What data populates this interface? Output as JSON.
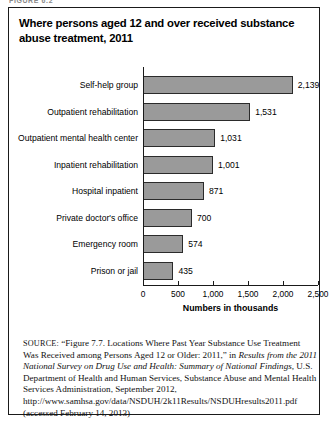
{
  "figure": {
    "label": "FIGURE 6.2",
    "title": "Where persons aged 12 and over received substance abuse treatment, 2011"
  },
  "chart_data": {
    "type": "bar",
    "orientation": "horizontal",
    "title": "Where persons aged 12 and over received substance abuse treatment, 2011",
    "xlabel": "Numbers in thousands",
    "ylabel": "",
    "xlim": [
      0,
      2500
    ],
    "xticks": [
      0,
      500,
      1000,
      1500,
      2000,
      2500
    ],
    "xtick_labels": [
      "0",
      "500",
      "1,000",
      "1,500",
      "2,000",
      "2,500"
    ],
    "grid": false,
    "legend": false,
    "categories": [
      "Self-help group",
      "Outpatient rehabilitation",
      "Outpatient mental health center",
      "Inpatient rehabilitation",
      "Hospital inpatient",
      "Private doctor's office",
      "Emergency room",
      "Prison or jail"
    ],
    "values": [
      2139,
      1531,
      1031,
      1001,
      871,
      700,
      574,
      435
    ],
    "value_labels": [
      "2,139",
      "1,531",
      "1,031",
      "1,001",
      "871",
      "700",
      "574",
      "435"
    ],
    "bar_color": "#9a9a9a",
    "bar_edge_color": "#2b2b2b"
  },
  "source": {
    "kicker": "SOURCE:",
    "part1": " “Figure 7.7. Locations Where Past Year Substance Use Treatment Was Received among Persons Aged 12 or Older: 2011,” in ",
    "italic1": "Results from the 2011 National Survey on Drug Use and Health: Summary of National Findings,",
    "part2": " U.S. Department of Health and Human Services, Substance Abuse and Mental Health Services Administration, September 2012, http://www.samhsa.gov/data/NSDUH/2k11Results/NSDUHresults2011.pdf (accessed February 14, 2013)"
  }
}
